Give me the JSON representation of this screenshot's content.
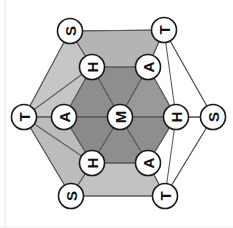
{
  "figure": {
    "background": "#ffffff",
    "rotation_deg": -90,
    "palette": {
      "face_dark": "#8e8e8e",
      "face_mid": "#a8a8a8",
      "face_light": "#c3c3c3",
      "face_pale": "#d6d6d6",
      "face_white": "#ffffff",
      "edge": "#5c5c5c",
      "node_fill": "#ffffff",
      "node_stroke": "#1a1a1a",
      "label": "#111111"
    },
    "nodes": [
      {
        "id": "outer-top-left",
        "label": "S",
        "ring": "outer",
        "cx": 70,
        "cy": 31,
        "r": 12.5
      },
      {
        "id": "outer-top-right",
        "label": "T",
        "ring": "outer",
        "cx": 164,
        "cy": 30,
        "r": 12.5
      },
      {
        "id": "outer-left",
        "label": "T",
        "ring": "outer",
        "cx": 24,
        "cy": 117,
        "r": 12.5
      },
      {
        "id": "outer-right",
        "label": "S",
        "ring": "outer",
        "cx": 213,
        "cy": 117,
        "r": 12.5
      },
      {
        "id": "outer-bottom-left",
        "label": "S",
        "ring": "outer",
        "cx": 71,
        "cy": 196,
        "r": 12.5
      },
      {
        "id": "outer-bottom-right",
        "label": "T",
        "ring": "outer",
        "cx": 165,
        "cy": 196,
        "r": 12.5
      },
      {
        "id": "inner-top-left",
        "label": "H",
        "ring": "inner",
        "cx": 92,
        "cy": 67,
        "r": 12.5
      },
      {
        "id": "inner-top-right",
        "label": "A",
        "ring": "inner",
        "cx": 148,
        "cy": 67,
        "r": 12.5
      },
      {
        "id": "inner-left",
        "label": "A",
        "ring": "inner",
        "cx": 64,
        "cy": 117,
        "r": 12.5
      },
      {
        "id": "inner-right",
        "label": "H",
        "ring": "inner",
        "cx": 176,
        "cy": 117,
        "r": 12.5
      },
      {
        "id": "inner-bottom-left",
        "label": "H",
        "ring": "inner",
        "cx": 92,
        "cy": 163,
        "r": 12.5
      },
      {
        "id": "inner-bottom-right",
        "label": "A",
        "ring": "inner",
        "cx": 148,
        "cy": 163,
        "r": 12.5
      },
      {
        "id": "center",
        "label": "M",
        "ring": "center",
        "cx": 120,
        "cy": 117,
        "r": 12.5
      }
    ],
    "faces": [
      {
        "id": "face-inner-upper-left",
        "shade": "#8e8e8e",
        "points": "92,67 120,117 64,117"
      },
      {
        "id": "face-inner-upper-right",
        "shade": "#8e8e8e",
        "points": "148,67 120,117 92,67"
      },
      {
        "id": "face-inner-right",
        "shade": "#999999",
        "points": "176,117 120,117 148,67"
      },
      {
        "id": "face-inner-lower-right",
        "shade": "#8e8e8e",
        "points": "148,163 120,117 176,117"
      },
      {
        "id": "face-inner-lower-left",
        "shade": "#8e8e8e",
        "points": "92,163 120,117 148,163"
      },
      {
        "id": "face-inner-left",
        "shade": "#8a8a8a",
        "points": "64,117 120,117 92,163"
      },
      {
        "id": "face-band-top",
        "shade": "#b4b4b4",
        "points": "70,31 164,30 148,67 92,67"
      },
      {
        "id": "face-band-upper-left",
        "shade": "#c6c6c6",
        "points": "70,31 92,67 64,117 24,117"
      },
      {
        "id": "face-band-lower-left",
        "shade": "#bcbcbc",
        "points": "24,117 64,117 92,163 71,196"
      },
      {
        "id": "face-band-bottom",
        "shade": "#c2c2c2",
        "points": "71,196 92,163 148,163 165,196"
      },
      {
        "id": "face-band-lower-right",
        "shade": "#ffffff",
        "points": "165,196 148,163 176,117 213,117"
      },
      {
        "id": "face-band-upper-right",
        "shade": "#ffffff",
        "points": "213,117 176,117 148,67 164,30"
      }
    ],
    "edges": [
      {
        "from": "outer-top-left",
        "to": "outer-top-right"
      },
      {
        "from": "outer-top-right",
        "to": "outer-right"
      },
      {
        "from": "outer-right",
        "to": "outer-bottom-right"
      },
      {
        "from": "outer-bottom-right",
        "to": "outer-bottom-left"
      },
      {
        "from": "outer-bottom-left",
        "to": "outer-left"
      },
      {
        "from": "outer-left",
        "to": "outer-top-left"
      },
      {
        "from": "inner-top-left",
        "to": "inner-top-right"
      },
      {
        "from": "inner-top-right",
        "to": "inner-right"
      },
      {
        "from": "inner-right",
        "to": "inner-bottom-right"
      },
      {
        "from": "inner-bottom-right",
        "to": "inner-bottom-left"
      },
      {
        "from": "inner-bottom-left",
        "to": "inner-left"
      },
      {
        "from": "inner-left",
        "to": "inner-top-left"
      },
      {
        "from": "outer-top-left",
        "to": "inner-top-left"
      },
      {
        "from": "outer-top-right",
        "to": "inner-top-right"
      },
      {
        "from": "outer-left",
        "to": "inner-left"
      },
      {
        "from": "outer-right",
        "to": "inner-right"
      },
      {
        "from": "outer-bottom-left",
        "to": "inner-bottom-left"
      },
      {
        "from": "outer-bottom-right",
        "to": "inner-bottom-right"
      },
      {
        "from": "center",
        "to": "inner-top-left"
      },
      {
        "from": "center",
        "to": "inner-top-right"
      },
      {
        "from": "center",
        "to": "inner-left"
      },
      {
        "from": "center",
        "to": "inner-right"
      },
      {
        "from": "center",
        "to": "inner-bottom-left"
      },
      {
        "from": "center",
        "to": "inner-bottom-right"
      },
      {
        "from": "outer-top-right",
        "to": "inner-right"
      },
      {
        "from": "outer-bottom-right",
        "to": "inner-right"
      },
      {
        "from": "outer-left",
        "to": "inner-top-left"
      },
      {
        "from": "outer-left",
        "to": "inner-bottom-left"
      }
    ]
  }
}
